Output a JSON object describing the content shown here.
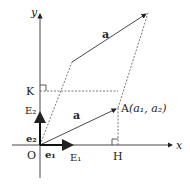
{
  "diagram": {
    "axes": {
      "x_label": "x",
      "y_label": "y",
      "origin_label": "O"
    },
    "points": {
      "A": {
        "label": "A",
        "coords": "(a₁,  a₂)",
        "a1": "a₁",
        "a2": "a₂"
      },
      "K": {
        "label": "K"
      },
      "H": {
        "label": "H"
      }
    },
    "vectors": {
      "a_upper": {
        "label": "a"
      },
      "a_lower": {
        "label": "a"
      },
      "e1": {
        "label": "e₁"
      },
      "e2": {
        "label": "e₂"
      },
      "E1": {
        "label": "E₁"
      },
      "E2": {
        "label": "E₂"
      }
    },
    "colors": {
      "line": "#333333",
      "dashed": "#555555",
      "background": "#ffffff"
    }
  }
}
